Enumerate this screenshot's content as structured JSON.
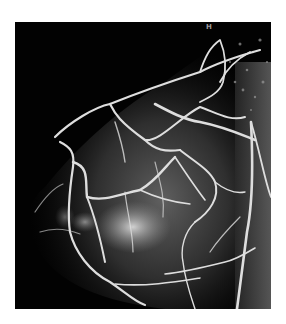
{
  "image": {
    "description": "Maximum intensity projection of breast MRI showing enhancing vasculature",
    "orientation_marker": "H",
    "colors": {
      "background": "#ffffff",
      "frame": "#020202",
      "vessel": "#dcdcdc",
      "tissue": "#5a5a5a"
    }
  }
}
